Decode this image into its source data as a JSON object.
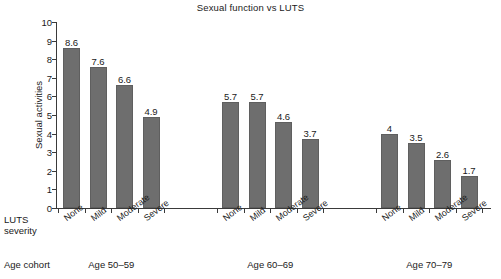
{
  "chart_data": {
    "type": "bar",
    "title": "Sexual function vs LUTS",
    "xlabel": "LUTS severity",
    "ylabel": "Sexual activities",
    "ylim": [
      0,
      10
    ],
    "yticks": [
      0,
      1,
      2,
      3,
      4,
      5,
      6,
      7,
      8,
      9,
      10
    ],
    "ytick_labels": [
      "0",
      "1",
      "2",
      "3",
      "4",
      "5",
      "6",
      "7",
      "8",
      "9",
      "10"
    ],
    "grid": false,
    "legend": "none",
    "bar_color": "#6e6e6e",
    "categories": [
      "None",
      "Mild",
      "Moderate",
      "Severe"
    ],
    "groups": [
      {
        "cohort": "Age 50–59",
        "categories": [
          "None",
          "Mild",
          "Moderate",
          "Severe"
        ],
        "values": [
          8.6,
          7.6,
          6.6,
          4.9
        ],
        "value_labels": [
          "8.6",
          "7.6",
          "6.6",
          "4.9"
        ]
      },
      {
        "cohort": "Age 60–69",
        "categories": [
          "None",
          "Mild",
          "Moderate",
          "Severe"
        ],
        "values": [
          5.7,
          5.7,
          4.6,
          3.7
        ],
        "value_labels": [
          "5.7",
          "5.7",
          "4.6",
          "3.7"
        ]
      },
      {
        "cohort": "Age 70–79",
        "categories": [
          "None",
          "Mild",
          "Moderate",
          "Severe"
        ],
        "values": [
          4.0,
          3.5,
          2.6,
          1.7
        ],
        "value_labels": [
          "4",
          "3.5",
          "2.6",
          "1.7"
        ]
      }
    ]
  },
  "axis_row_labels": {
    "luts_line1": "LUTS",
    "luts_line2": "severity",
    "cohort": "Age cohort"
  }
}
